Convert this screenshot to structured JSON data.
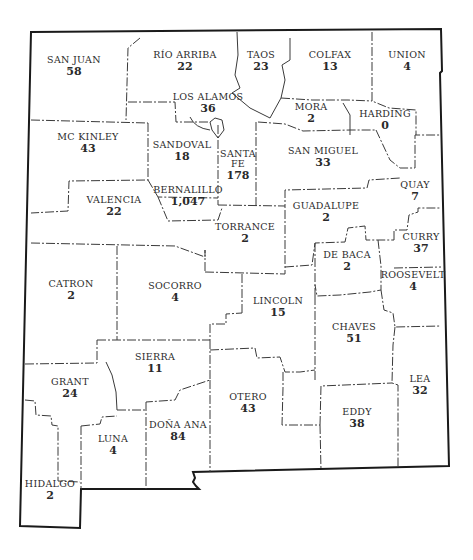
{
  "map": {
    "region": "New Mexico",
    "counties": [
      {
        "id": "san-juan",
        "name": "SAN JUAN",
        "value": "58",
        "x": 74,
        "y": 63
      },
      {
        "id": "rio-arriba",
        "name": "RÍO ARRIBA",
        "value": "22",
        "x": 185,
        "y": 58
      },
      {
        "id": "taos",
        "name": "TAOS",
        "value": "23",
        "x": 261,
        "y": 58
      },
      {
        "id": "colfax",
        "name": "COLFAX",
        "value": "13",
        "x": 330,
        "y": 58
      },
      {
        "id": "union",
        "name": "UNION",
        "value": "4",
        "x": 407,
        "y": 58
      },
      {
        "id": "los-alamos",
        "name": "LOS ALAMOS",
        "value": "36",
        "x": 208,
        "y": 100
      },
      {
        "id": "mora",
        "name": "MORA",
        "value": "2",
        "x": 311,
        "y": 110
      },
      {
        "id": "harding",
        "name": "HARDING",
        "value": "0",
        "x": 385,
        "y": 117
      },
      {
        "id": "mc-kinley",
        "name": "MC KINLEY",
        "value": "43",
        "x": 88,
        "y": 140
      },
      {
        "id": "sandoval",
        "name": "SANDOVAL",
        "value": "18",
        "x": 182,
        "y": 148
      },
      {
        "id": "santa-fe",
        "name": "SANTA\nFE",
        "value": "178",
        "x": 238,
        "y": 157
      },
      {
        "id": "san-miguel",
        "name": "SAN MIGUEL",
        "value": "33",
        "x": 323,
        "y": 154
      },
      {
        "id": "bernalillo",
        "name": "BERNALILLO",
        "value": "1,047",
        "x": 188,
        "y": 193
      },
      {
        "id": "valencia",
        "name": "VALENCIA",
        "value": "22",
        "x": 114,
        "y": 203
      },
      {
        "id": "quay",
        "name": "QUAY",
        "value": "7",
        "x": 415,
        "y": 188
      },
      {
        "id": "guadalupe",
        "name": "GUADALUPE",
        "value": "2",
        "x": 326,
        "y": 209
      },
      {
        "id": "torrance",
        "name": "TORRANCE",
        "value": "2",
        "x": 245,
        "y": 230
      },
      {
        "id": "curry",
        "name": "CURRY",
        "value": "37",
        "x": 421,
        "y": 240
      },
      {
        "id": "de-baca",
        "name": "DE BACA",
        "value": "2",
        "x": 347,
        "y": 258
      },
      {
        "id": "catron",
        "name": "CATRON",
        "value": "2",
        "x": 71,
        "y": 287
      },
      {
        "id": "socorro",
        "name": "SOCORRO",
        "value": "4",
        "x": 175,
        "y": 289
      },
      {
        "id": "roosevelt",
        "name": "ROOSEVELT",
        "value": "4",
        "x": 413,
        "y": 278
      },
      {
        "id": "lincoln",
        "name": "LINCOLN",
        "value": "15",
        "x": 278,
        "y": 304
      },
      {
        "id": "chaves",
        "name": "CHAVES",
        "value": "51",
        "x": 354,
        "y": 330
      },
      {
        "id": "sierra",
        "name": "SIERRA",
        "value": "11",
        "x": 155,
        "y": 360
      },
      {
        "id": "grant",
        "name": "GRANT",
        "value": "24",
        "x": 70,
        "y": 385
      },
      {
        "id": "lea",
        "name": "LEA",
        "value": "32",
        "x": 420,
        "y": 382
      },
      {
        "id": "otero",
        "name": "OTERO",
        "value": "43",
        "x": 248,
        "y": 400
      },
      {
        "id": "eddy",
        "name": "EDDY",
        "value": "38",
        "x": 357,
        "y": 415
      },
      {
        "id": "dona-ana",
        "name": "DOÑA ANA",
        "value": "84",
        "x": 178,
        "y": 428
      },
      {
        "id": "luna",
        "name": "LUNA",
        "value": "4",
        "x": 113,
        "y": 442
      },
      {
        "id": "hidalgo",
        "name": "HIDALGO",
        "value": "2",
        "x": 50,
        "y": 487
      }
    ]
  }
}
